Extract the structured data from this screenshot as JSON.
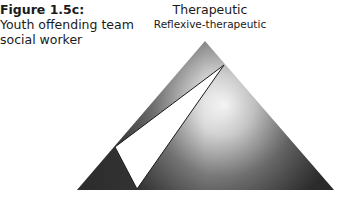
{
  "figure": {
    "title": "Figure 1.5c:",
    "subtitle_line1": "Youth offending team",
    "subtitle_line2": "social worker"
  },
  "diagram": {
    "apex_label": "Therapeutic",
    "apex_sublabel": "Reflexive-therapeutic",
    "outer_triangle": {
      "apex": [
        205,
        41
      ],
      "base_left": [
        77,
        190
      ],
      "base_right": [
        334,
        190
      ]
    },
    "inner_triangle": {
      "top": [
        224,
        65
      ],
      "left": [
        115,
        147
      ],
      "bottom": [
        137,
        189
      ]
    },
    "colors": {
      "dark": "#3c3c3c",
      "light": "#ffffff",
      "inner_fill": "#ffffff",
      "outline": "#1a1a1a"
    }
  }
}
